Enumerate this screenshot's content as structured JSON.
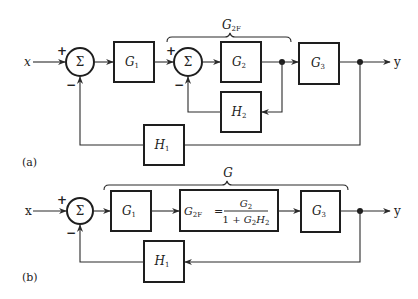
{
  "diagram_a": {
    "caption": "(a)",
    "input_label": "x",
    "output_label": "y",
    "sum1": {
      "symbol": "Σ",
      "plus": "+",
      "minus": "−"
    },
    "sum2": {
      "symbol": "Σ",
      "plus": "+",
      "minus": "−"
    },
    "g1": {
      "main": "G",
      "sub": "1"
    },
    "g2": {
      "main": "G",
      "sub": "2"
    },
    "g3": {
      "main": "G",
      "sub": "3"
    },
    "h1": {
      "main": "H",
      "sub": "1"
    },
    "h2": {
      "main": "H",
      "sub": "2"
    },
    "brace_label": {
      "main": "G",
      "sub": "2F"
    }
  },
  "diagram_b": {
    "caption": "(b)",
    "input_label": "x",
    "output_label": "y",
    "sum1": {
      "symbol": "Σ",
      "plus": "+",
      "minus": "−"
    },
    "g1": {
      "main": "G",
      "sub": "1"
    },
    "g2f": {
      "lhs_main": "G",
      "lhs_sub": "2F",
      "equals": "=",
      "numerator_main": "G",
      "numerator_sub": "2",
      "denominator_prefix": "1 + ",
      "denominator_g": "G",
      "denominator_g_sub": "2",
      "denominator_h": "H",
      "denominator_h_sub": "2"
    },
    "g3": {
      "main": "G",
      "sub": "3"
    },
    "h1": {
      "main": "H",
      "sub": "1"
    },
    "brace_label": {
      "main": "G"
    }
  }
}
